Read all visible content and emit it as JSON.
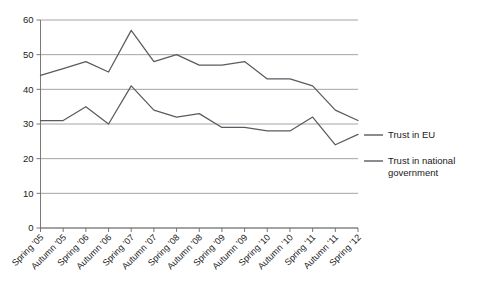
{
  "chart_data": {
    "type": "line",
    "title": "",
    "xlabel": "",
    "ylabel": "",
    "ylim": [
      0,
      60
    ],
    "ytick_step": 10,
    "grid": true,
    "legend_position": "right",
    "categories": [
      "Spring '05",
      "Autumn '05",
      "Spring '06",
      "Autumn '06",
      "Spring '07",
      "Autumn '07",
      "Spring '08",
      "Autumn '08",
      "Spring '09",
      "Autumn '09",
      "Spring '10",
      "Autumn '10",
      "Spring '11",
      "Autumn '11",
      "Spring '12"
    ],
    "ytick_labels": [
      "0",
      "10",
      "20",
      "30",
      "40",
      "50",
      "60"
    ],
    "ytick_values": [
      0,
      10,
      20,
      30,
      40,
      50,
      60
    ],
    "series": [
      {
        "name": "Trust in EU",
        "color": "#5a5a62",
        "values": [
          44,
          46,
          48,
          45,
          57,
          48,
          50,
          47,
          47,
          48,
          43,
          43,
          41,
          34,
          31
        ]
      },
      {
        "name": "Trust in national government",
        "color": "#5a5a62",
        "values": [
          31,
          31,
          35,
          30,
          41,
          34,
          32,
          33,
          29,
          29,
          28,
          28,
          32,
          24,
          27
        ]
      }
    ]
  },
  "legend": {
    "items": [
      {
        "label": "Trust in EU"
      },
      {
        "label": "Trust in national",
        "label2": "government"
      }
    ]
  }
}
